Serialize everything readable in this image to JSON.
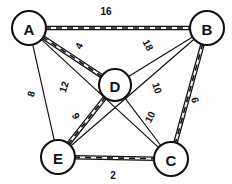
{
  "figure": {
    "type": "node-link-diagram",
    "background_color": "#fdfdfd",
    "stroke_color": "#111111"
  },
  "nodes": [
    {
      "id": "A",
      "label": "A",
      "cx": 29,
      "cy": 28,
      "r": 17
    },
    {
      "id": "B",
      "label": "B",
      "cx": 207,
      "cy": 28,
      "r": 17
    },
    {
      "id": "D",
      "label": "D",
      "cx": 115,
      "cy": 85,
      "r": 16
    },
    {
      "id": "E",
      "label": "E",
      "cx": 58,
      "cy": 157,
      "r": 17
    },
    {
      "id": "C",
      "label": "C",
      "cx": 171,
      "cy": 159,
      "r": 17
    }
  ],
  "edges": [
    {
      "id": "AB",
      "from": "A",
      "to": "B",
      "weight": "16",
      "highlighted": true,
      "label_x": 106,
      "label_y": 11,
      "label_rot": 0
    },
    {
      "id": "AD",
      "from": "A",
      "to": "D",
      "weight": "4",
      "highlighted": true,
      "label_x": 79,
      "label_y": 46,
      "label_rot": -62
    },
    {
      "id": "AC",
      "from": "A",
      "to": "C",
      "weight": "12",
      "highlighted": false,
      "label_x": 64,
      "label_y": 87,
      "label_rot": -72
    },
    {
      "id": "AE",
      "from": "A",
      "to": "E",
      "weight": "8",
      "highlighted": false,
      "label_x": 31,
      "label_y": 94,
      "label_rot": -75
    },
    {
      "id": "BD",
      "from": "B",
      "to": "D",
      "weight": "18",
      "highlighted": false,
      "label_x": 148,
      "label_y": 45,
      "label_rot": 62
    },
    {
      "id": "BE",
      "from": "B",
      "to": "E",
      "weight": "10",
      "highlighted": false,
      "label_x": 157,
      "label_y": 88,
      "label_rot": 72
    },
    {
      "id": "BC",
      "from": "B",
      "to": "C",
      "weight": "6",
      "highlighted": true,
      "label_x": 195,
      "label_y": 100,
      "label_rot": 75
    },
    {
      "id": "DE",
      "from": "D",
      "to": "E",
      "weight": "9",
      "highlighted": true,
      "label_x": 76,
      "label_y": 116,
      "label_rot": 62
    },
    {
      "id": "DC",
      "from": "D",
      "to": "C",
      "weight": "10",
      "highlighted": false,
      "label_x": 150,
      "label_y": 117,
      "label_rot": -62
    },
    {
      "id": "EC",
      "from": "E",
      "to": "C",
      "weight": "2",
      "highlighted": true,
      "label_x": 113,
      "label_y": 175,
      "label_rot": 0
    }
  ],
  "chart_data": {
    "type": "graph",
    "vertices": [
      "A",
      "B",
      "C",
      "D",
      "E"
    ],
    "edge_list": [
      {
        "u": "A",
        "v": "B",
        "w": 16
      },
      {
        "u": "A",
        "v": "D",
        "w": 4
      },
      {
        "u": "A",
        "v": "C",
        "w": 12
      },
      {
        "u": "A",
        "v": "E",
        "w": 8
      },
      {
        "u": "B",
        "v": "D",
        "w": 18
      },
      {
        "u": "B",
        "v": "E",
        "w": 10
      },
      {
        "u": "B",
        "v": "C",
        "w": 6
      },
      {
        "u": "D",
        "v": "E",
        "w": 9
      },
      {
        "u": "D",
        "v": "C",
        "w": 10
      },
      {
        "u": "E",
        "v": "C",
        "w": 2
      }
    ],
    "highlighted_edges": [
      "A-B",
      "A-D",
      "D-E",
      "E-C",
      "B-C"
    ]
  }
}
